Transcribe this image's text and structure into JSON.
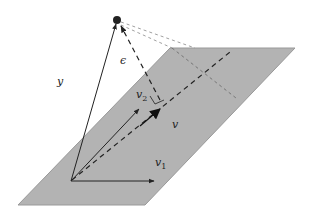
{
  "diagram": {
    "colors": {
      "plane_fill": "#b3b3b3",
      "plane_edge": "#999999",
      "stroke": "#222222",
      "guide": "#777777",
      "background": "#ffffff"
    },
    "labels": {
      "y": "y",
      "epsilon": "ϵ",
      "v2_base": "v",
      "v2_sub": "2",
      "v": "v",
      "v1_base": "v",
      "v1_sub": "1"
    },
    "points": {
      "origin": [
        71,
        181
      ],
      "y_tip": [
        117,
        20
      ],
      "projection_foot": [
        160,
        100
      ],
      "v1_tip": [
        160,
        181
      ],
      "v2_tip": [
        141,
        107
      ]
    },
    "plane": [
      [
        18,
        205
      ],
      [
        145,
        205
      ],
      [
        295,
        48
      ],
      [
        170,
        48
      ]
    ]
  }
}
